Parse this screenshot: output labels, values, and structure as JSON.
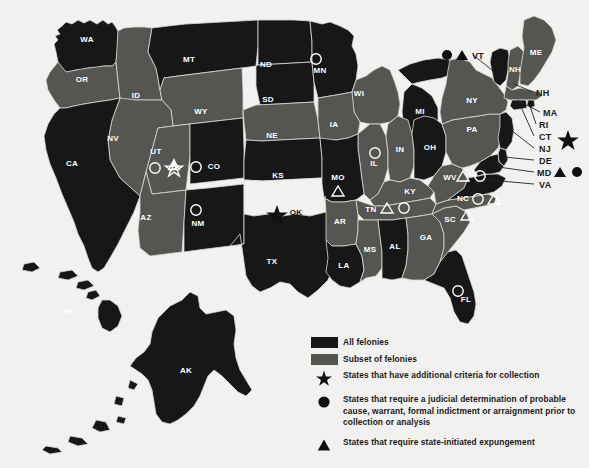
{
  "colors": {
    "background": "#f1f1ef",
    "all_felonies": "#171717",
    "subset_of_felonies": "#555552",
    "no_category": "#f1f1ef",
    "border": "#d8d8d4",
    "label_light": "#ffffff",
    "label_dark": "#111111",
    "marker_outline": "#ffffff",
    "marker_solid": "#111111"
  },
  "legend": {
    "items": [
      {
        "key": "swatch-dark",
        "symbol": "filled-rectangle",
        "label": "All felonies"
      },
      {
        "key": "swatch-gray",
        "symbol": "filled-rectangle",
        "label": "Subset of felonies"
      },
      {
        "key": "star",
        "symbol": "star",
        "label": "States that have additional criteria for collection"
      },
      {
        "key": "circle",
        "symbol": "circle",
        "label": "States that require a judicial determination of probable cause, warrant, formal indictment or arraignment prior to collection or analysis"
      },
      {
        "key": "triangle",
        "symbol": "triangle",
        "label": "States that require state-initiated expungement"
      }
    ]
  },
  "map": {
    "states": [
      {
        "abbr": "WA",
        "category": "all_felonies",
        "markers": []
      },
      {
        "abbr": "OR",
        "category": "subset_of_felonies",
        "markers": []
      },
      {
        "abbr": "ID",
        "category": "subset_of_felonies",
        "markers": []
      },
      {
        "abbr": "MT",
        "category": "all_felonies",
        "markers": []
      },
      {
        "abbr": "WY",
        "category": "subset_of_felonies",
        "markers": []
      },
      {
        "abbr": "ND",
        "category": "all_felonies",
        "markers": []
      },
      {
        "abbr": "SD",
        "category": "all_felonies",
        "markers": []
      },
      {
        "abbr": "NE",
        "category": "subset_of_felonies",
        "markers": []
      },
      {
        "abbr": "MN",
        "category": "all_felonies",
        "markers": [
          "circle"
        ]
      },
      {
        "abbr": "WI",
        "category": "subset_of_felonies",
        "markers": []
      },
      {
        "abbr": "IA",
        "category": "subset_of_felonies",
        "markers": []
      },
      {
        "abbr": "CA",
        "category": "all_felonies",
        "markers": []
      },
      {
        "abbr": "NV",
        "category": "subset_of_felonies",
        "markers": []
      },
      {
        "abbr": "UT",
        "category": "subset_of_felonies",
        "markers": [
          "circle",
          "star"
        ]
      },
      {
        "abbr": "CO",
        "category": "all_felonies",
        "markers": [
          "circle"
        ]
      },
      {
        "abbr": "AZ",
        "category": "subset_of_felonies",
        "markers": []
      },
      {
        "abbr": "NM",
        "category": "all_felonies",
        "markers": [
          "circle"
        ]
      },
      {
        "abbr": "KS",
        "category": "all_felonies",
        "markers": []
      },
      {
        "abbr": "OK",
        "category": "no_category",
        "markers": [
          "star-solid"
        ]
      },
      {
        "abbr": "TX",
        "category": "all_felonies",
        "markers": []
      },
      {
        "abbr": "MO",
        "category": "all_felonies",
        "markers": [
          "triangle"
        ]
      },
      {
        "abbr": "AR",
        "category": "subset_of_felonies",
        "markers": []
      },
      {
        "abbr": "LA",
        "category": "all_felonies",
        "markers": []
      },
      {
        "abbr": "IL",
        "category": "subset_of_felonies",
        "markers": [
          "circle"
        ]
      },
      {
        "abbr": "MI",
        "category": "all_felonies",
        "markers": []
      },
      {
        "abbr": "IN",
        "category": "subset_of_felonies",
        "markers": []
      },
      {
        "abbr": "OH",
        "category": "all_felonies",
        "markers": []
      },
      {
        "abbr": "KY",
        "category": "subset_of_felonies",
        "markers": []
      },
      {
        "abbr": "TN",
        "category": "subset_of_felonies",
        "markers": [
          "triangle",
          "circle"
        ]
      },
      {
        "abbr": "MS",
        "category": "subset_of_felonies",
        "markers": []
      },
      {
        "abbr": "AL",
        "category": "all_felonies",
        "markers": []
      },
      {
        "abbr": "GA",
        "category": "subset_of_felonies",
        "markers": []
      },
      {
        "abbr": "FL",
        "category": "all_felonies",
        "markers": [
          "circle"
        ]
      },
      {
        "abbr": "SC",
        "category": "subset_of_felonies",
        "markers": [
          "triangle"
        ]
      },
      {
        "abbr": "NC",
        "category": "subset_of_felonies",
        "markers": [
          "circle",
          "triangle"
        ]
      },
      {
        "abbr": "WV",
        "category": "subset_of_felonies",
        "markers": [
          "triangle",
          "circle"
        ]
      },
      {
        "abbr": "VA",
        "category": "all_felonies",
        "markers": []
      },
      {
        "abbr": "PA",
        "category": "subset_of_felonies",
        "markers": []
      },
      {
        "abbr": "NY",
        "category": "subset_of_felonies",
        "markers": []
      },
      {
        "abbr": "ME",
        "category": "subset_of_felonies",
        "markers": []
      },
      {
        "abbr": "NH",
        "category": "subset_of_felonies",
        "markers": []
      },
      {
        "abbr": "VT",
        "category": "all_felonies",
        "markers": []
      },
      {
        "abbr": "MA",
        "category": "subset_of_felonies",
        "markers": []
      },
      {
        "abbr": "RI",
        "category": "all_felonies",
        "markers": []
      },
      {
        "abbr": "CT",
        "category": "all_felonies",
        "markers": []
      },
      {
        "abbr": "NJ",
        "category": "all_felonies",
        "markers": []
      },
      {
        "abbr": "DE",
        "category": "all_felonies",
        "markers": []
      },
      {
        "abbr": "MD",
        "category": "all_felonies",
        "markers": []
      },
      {
        "abbr": "AK",
        "category": "all_felonies",
        "markers": []
      },
      {
        "abbr": "HI",
        "category": "all_felonies",
        "markers": []
      }
    ],
    "callouts": [
      {
        "abbr": "VT",
        "markers": [
          "circle-solid",
          "triangle-solid"
        ]
      },
      {
        "abbr": "NH",
        "markers": []
      },
      {
        "abbr": "MA",
        "markers": []
      },
      {
        "abbr": "RI",
        "markers": []
      },
      {
        "abbr": "CT",
        "markers": [
          "star-solid"
        ]
      },
      {
        "abbr": "NJ",
        "markers": []
      },
      {
        "abbr": "DE",
        "markers": []
      },
      {
        "abbr": "MD",
        "markers": [
          "triangle-solid",
          "circle-solid"
        ]
      },
      {
        "abbr": "VA",
        "markers": []
      }
    ]
  }
}
